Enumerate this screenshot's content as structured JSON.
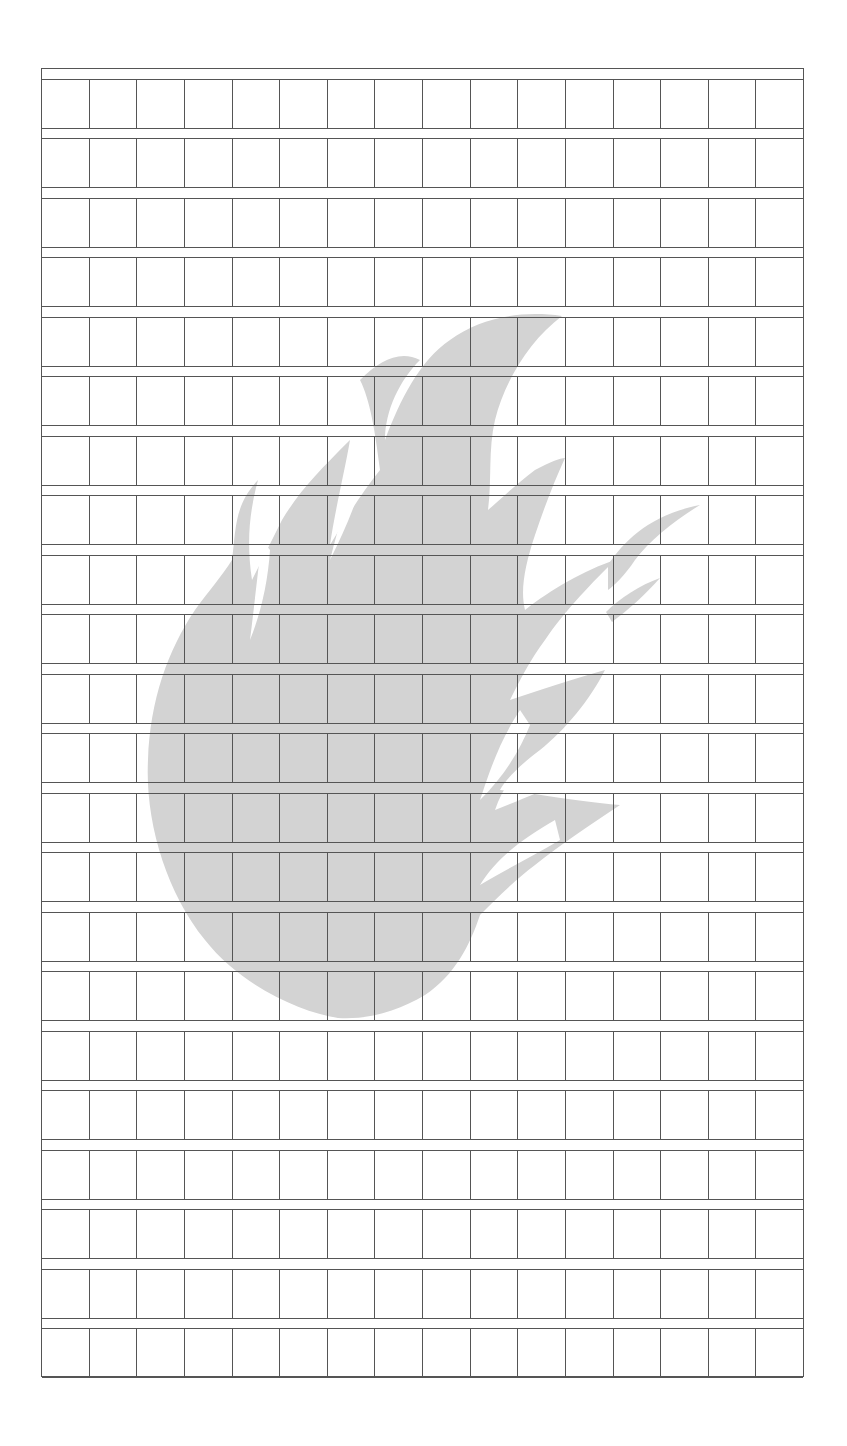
{
  "sheet": {
    "type": "grid-writing-sheet",
    "rows": 22,
    "columns": 16,
    "cells_filled": 0,
    "line_color": "#555555",
    "background_color": "#ffffff"
  },
  "watermark": {
    "icon": "flame-icon",
    "color": "#d3d3d3"
  }
}
